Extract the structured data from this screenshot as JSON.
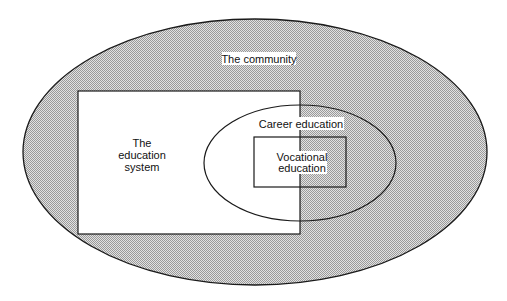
{
  "diagram": {
    "type": "nested-venn",
    "colors": {
      "background": "#ffffff",
      "shade_light": "#e2e2e2",
      "shade_dark": "#9a9a9a",
      "stroke": "#1a1a1a",
      "label_bg": "#ffffff"
    },
    "regions": {
      "community": {
        "shape": "ellipse",
        "label": "The community",
        "cx": 255,
        "cy": 152,
        "rx": 232,
        "ry": 133
      },
      "education_system": {
        "shape": "rect",
        "label_lines": [
          "The",
          "education",
          "system"
        ],
        "x": 78,
        "y": 91,
        "w": 222,
        "h": 143
      },
      "career_education": {
        "shape": "ellipse",
        "label": "Career education",
        "cx": 300,
        "cy": 163,
        "rx": 96,
        "ry": 58
      },
      "vocational_education": {
        "shape": "rect",
        "label_lines": [
          "Vocational",
          "education"
        ],
        "x": 254,
        "y": 137,
        "w": 92,
        "h": 50
      }
    }
  }
}
